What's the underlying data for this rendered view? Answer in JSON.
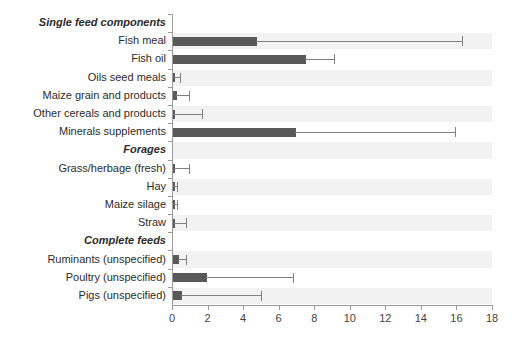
{
  "chart_data": {
    "type": "bar",
    "orientation": "horizontal",
    "title": "",
    "subtitle": "",
    "xlabel": "",
    "ylabel": "",
    "xlim": [
      0,
      18
    ],
    "xticks": [
      0,
      2,
      4,
      6,
      8,
      10,
      12,
      14,
      16,
      18
    ],
    "xtick_labels": [
      "0",
      "2",
      "4",
      "6",
      "8",
      "10",
      "12",
      "14",
      "16",
      "18"
    ],
    "grid": false,
    "legend": null,
    "bar_color": "#595959",
    "error_color": "#808080",
    "band_color": "#f2f2f2",
    "axis_color": "#9a9a9a",
    "error_bars": "upper only (whisker to the right of each bar)",
    "categories": [
      {
        "label": "Single feed components",
        "group": true,
        "value": null,
        "error_high": null
      },
      {
        "label": "Fish meal",
        "group": false,
        "value": 4.7,
        "error_high": 16.3
      },
      {
        "label": "Fish oil",
        "group": false,
        "value": 7.5,
        "error_high": 9.1
      },
      {
        "label": "Oils seed meals",
        "group": false,
        "value": 0.12,
        "error_high": 0.45
      },
      {
        "label": "Maize grain and  products",
        "group": false,
        "value": 0.25,
        "error_high": 0.95
      },
      {
        "label": "Other cereals and products",
        "group": false,
        "value": 0.08,
        "error_high": 1.7
      },
      {
        "label": "Minerals supplements",
        "group": false,
        "value": 6.9,
        "error_high": 15.9
      },
      {
        "label": "Forages",
        "group": true,
        "value": null,
        "error_high": null
      },
      {
        "label": "Grass/herbage (fresh)",
        "group": false,
        "value": 0.1,
        "error_high": 0.95
      },
      {
        "label": "Hay",
        "group": false,
        "value": 0.08,
        "error_high": 0.3
      },
      {
        "label": "Maize silage",
        "group": false,
        "value": 0.08,
        "error_high": 0.3
      },
      {
        "label": "Straw",
        "group": false,
        "value": 0.1,
        "error_high": 0.8
      },
      {
        "label": "Complete feeds",
        "group": true,
        "value": null,
        "error_high": null
      },
      {
        "label": "Ruminants (unspecified)",
        "group": false,
        "value": 0.35,
        "error_high": 0.8
      },
      {
        "label": "Poultry (unspecified)",
        "group": false,
        "value": 1.9,
        "error_high": 6.8
      },
      {
        "label": "Pigs (unspecified)",
        "group": false,
        "value": 0.5,
        "error_high": 5.0
      }
    ]
  }
}
